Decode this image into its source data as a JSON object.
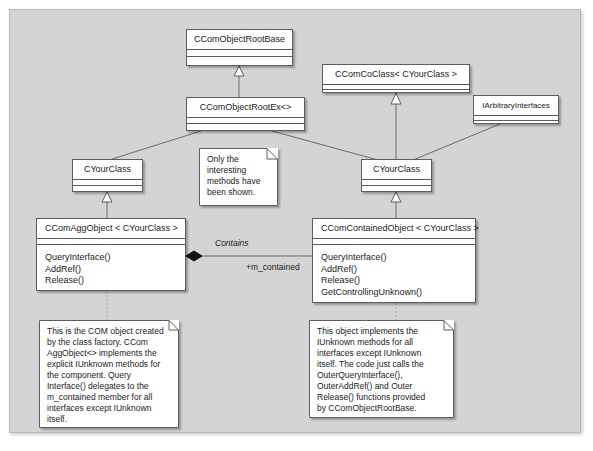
{
  "diagram": {
    "type": "uml-class-diagram",
    "canvas_color": "#d4d4d4",
    "box_fill": "#ffffff",
    "line_color": "#6b6b6b",
    "border_color": "#5d5d5d",
    "classes": [
      {
        "id": "ccomobjectrootbase",
        "name": "CComObjectRootBase",
        "operations": []
      },
      {
        "id": "ccomcoclass",
        "name": "CComCoClass< CYourClass >",
        "operations": []
      },
      {
        "id": "ccomobjectrootex",
        "name": "CComObjectRootEx<>",
        "operations": []
      },
      {
        "id": "iarbitraryinterfaces",
        "name": "IArbitraryInterfaces",
        "operations": []
      },
      {
        "id": "cyourclass-left",
        "name": "CYourClass",
        "operations": []
      },
      {
        "id": "cyourclass-right",
        "name": "CYourClass",
        "operations": []
      },
      {
        "id": "ccomaggobject",
        "name": "CComAggObject < CYourClass >",
        "operations": [
          "QueryInterface()",
          "AddRef()",
          "Release()"
        ]
      },
      {
        "id": "ccomcontainedobject",
        "name": "CComContainedObject < CYourClass >",
        "operations": [
          "QueryInterface()",
          "AddRef()",
          "Release()",
          "GetControllingUnknown()"
        ]
      }
    ],
    "notes": [
      {
        "id": "note-methods",
        "lines": [
          "Only the",
          "interesting",
          "methods have",
          "been shown."
        ]
      },
      {
        "id": "note-aggobject",
        "lines": [
          "This is the COM object created",
          "by the class factory. CCom",
          "AggObject<> implements the",
          "explicit IUnknown methods for",
          "the component. Query",
          "Interface() delegates to the",
          "m_contained member for all",
          "interfaces except IUnknown",
          "itself."
        ]
      },
      {
        "id": "note-containedobject",
        "lines": [
          "This object implements the",
          "IUnknown methods for all",
          "interfaces except IUnknown",
          "itself. The code just calls the",
          "OuterQueryInterface(),",
          "OuterAddRef() and Outer",
          "Release() functions provided",
          "by CComObjectRootBase."
        ]
      }
    ],
    "association": {
      "name": "Contains",
      "role": "+m_contained",
      "aggregation": "composite"
    }
  }
}
